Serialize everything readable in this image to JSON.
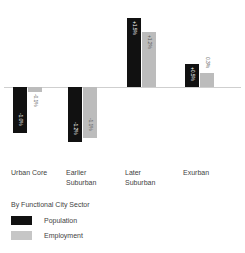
{
  "chart_data": {
    "type": "bar",
    "title": "",
    "subtitle": "",
    "xlabel": "By Functional City Sector",
    "ylabel": "",
    "grid": false,
    "legend_position": "bottom-left",
    "orientation": "vertical",
    "grouped": true,
    "zero_line": true,
    "ylim": [
      -1.4,
      1.7
    ],
    "units": "percent",
    "categories": [
      "Urban Core",
      "Earlier Suburban",
      "Later Suburban",
      "Exurban"
    ],
    "category_lines": [
      [
        "Urban Core"
      ],
      [
        "Earlier",
        "Suburban"
      ],
      [
        "Later",
        "Suburban"
      ],
      [
        "Exurban"
      ]
    ],
    "series": [
      {
        "name": "Population",
        "color": "#111111",
        "values": [
          -1.0,
          -1.2,
          1.5,
          0.5
        ],
        "labels": [
          "-1.0%",
          "-1.2%",
          "+1.5%",
          "+0.5%"
        ]
      },
      {
        "name": "Employment",
        "color": "#bcbcbc",
        "values": [
          -0.1,
          -1.1,
          1.2,
          0.3
        ],
        "labels": [
          "-0.1%",
          "-1.1%",
          "+1.2%",
          "0.3%"
        ]
      }
    ]
  },
  "legend": {
    "title": "By Functional City Sector",
    "entries": [
      {
        "label": "Population",
        "color": "#111111"
      },
      {
        "label": "Employment",
        "color": "#c6c6c6"
      }
    ]
  }
}
